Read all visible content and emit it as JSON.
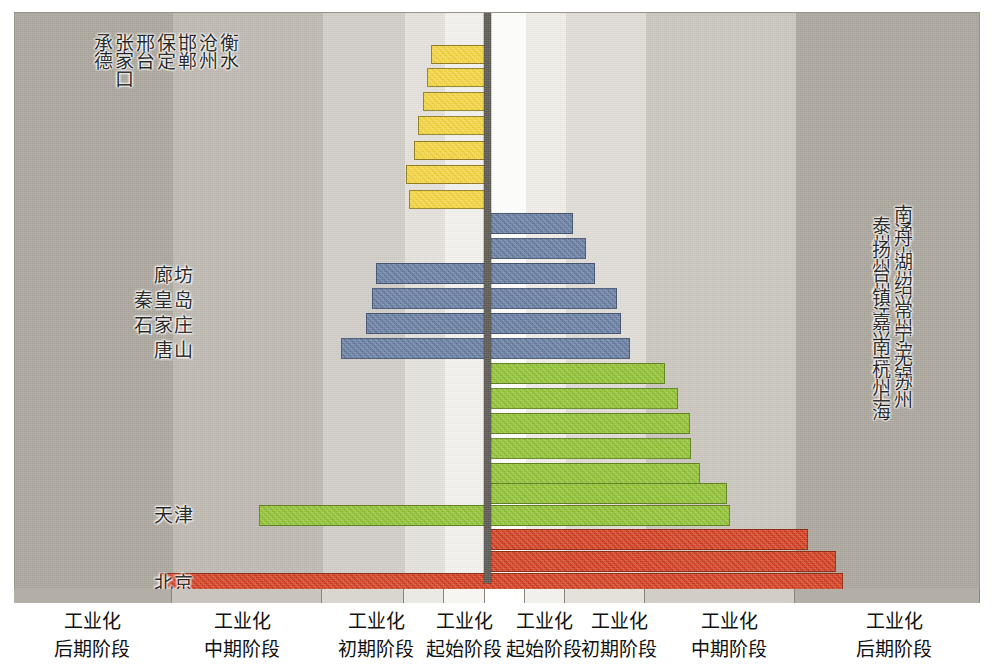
{
  "chart_data": {
    "type": "bar",
    "orientation": "horizontal-diverging",
    "title": "",
    "xlabel": "",
    "ylabel": "",
    "grid": false,
    "legend_position": "none",
    "center_axis_x": 487,
    "axis_band_labels": [
      {
        "line1": "工业化",
        "line2": "后期阶段",
        "side": "left"
      },
      {
        "line1": "工业化",
        "line2": "中期阶段",
        "side": "left"
      },
      {
        "line1": "工业化",
        "line2": "初期阶段",
        "side": "left"
      },
      {
        "line1": "工业化",
        "line2": "起始阶段",
        "side": "left"
      },
      {
        "line1": "工业化",
        "line2": "起始阶段",
        "side": "right"
      },
      {
        "line1": "工业化",
        "line2": "初期阶段",
        "side": "right"
      },
      {
        "line1": "工业化",
        "line2": "中期阶段",
        "side": "right"
      },
      {
        "line1": "工业化",
        "line2": "后期阶段",
        "side": "right"
      }
    ],
    "colors": {
      "yellow": "#f2d23c",
      "blue": "#64799e",
      "green": "#8dbf30",
      "red": "#cf3a1c",
      "axis": "#5b5852",
      "plot_background": "#b8b3ab"
    },
    "series": [
      {
        "name": "yellow",
        "color": "#f2d23c",
        "bars": [
          {
            "left": 431,
            "right": 487,
            "top": 45,
            "height": 19
          },
          {
            "left": 427,
            "right": 487,
            "top": 68,
            "height": 19
          },
          {
            "left": 423,
            "right": 487,
            "top": 92,
            "height": 19
          },
          {
            "left": 418,
            "right": 487,
            "top": 116,
            "height": 19
          },
          {
            "left": 414,
            "right": 487,
            "top": 141,
            "height": 19
          },
          {
            "left": 406,
            "right": 487,
            "top": 165,
            "height": 19
          },
          {
            "left": 409,
            "right": 487,
            "top": 190,
            "height": 19
          }
        ]
      },
      {
        "name": "blue",
        "color": "#64799e",
        "bars": [
          {
            "left": 487,
            "right": 573,
            "top": 213,
            "height": 21
          },
          {
            "left": 487,
            "right": 586,
            "top": 238,
            "height": 21
          },
          {
            "left": 376,
            "right": 595,
            "top": 263,
            "height": 21
          },
          {
            "left": 372,
            "right": 617,
            "top": 288,
            "height": 21
          },
          {
            "left": 366,
            "right": 621,
            "top": 313,
            "height": 21
          },
          {
            "left": 341,
            "right": 630,
            "top": 338,
            "height": 21
          }
        ]
      },
      {
        "name": "green",
        "color": "#8dbf30",
        "bars": [
          {
            "left": 487,
            "right": 665,
            "top": 363,
            "height": 21
          },
          {
            "left": 487,
            "right": 678,
            "top": 388,
            "height": 21
          },
          {
            "left": 487,
            "right": 690,
            "top": 413,
            "height": 21
          },
          {
            "left": 487,
            "right": 691,
            "top": 438,
            "height": 21
          },
          {
            "left": 487,
            "right": 700,
            "top": 463,
            "height": 21
          },
          {
            "left": 487,
            "right": 727,
            "top": 483,
            "height": 21
          },
          {
            "left": 259,
            "right": 730,
            "top": 505,
            "height": 21
          }
        ]
      },
      {
        "name": "red",
        "color": "#cf3a1c",
        "bars": [
          {
            "left": 487,
            "right": 808,
            "top": 529,
            "height": 21
          },
          {
            "left": 487,
            "right": 836,
            "top": 551,
            "height": 21
          },
          {
            "left": 160,
            "right": 843,
            "top": 573,
            "height": 21
          }
        ]
      }
    ],
    "left_vertical_labels": [
      "承德",
      "张家口",
      "邢台",
      "保定",
      "邯郸",
      "沧州",
      "衡水"
    ],
    "left_horizontal_labels": [
      {
        "text": "廊坊",
        "top": 260,
        "right": 196
      },
      {
        "text": "秦皇岛",
        "top": 285,
        "right": 196
      },
      {
        "text": "石家庄",
        "top": 310,
        "right": 196
      },
      {
        "text": "唐山",
        "top": 335,
        "right": 196
      },
      {
        "text": "天津",
        "top": 500,
        "right": 196
      },
      {
        "text": "北京",
        "top": 568,
        "right": 196
      }
    ],
    "right_vertical_labels": [
      "泰州",
      "南通",
      "扬州",
      "舟山",
      "台州",
      "湖州",
      "镇江",
      "绍兴",
      "嘉兴",
      "常州",
      "南京",
      "宁波",
      "杭州",
      "无锡",
      "上海",
      "苏州"
    ],
    "background_bands": [
      {
        "x": 0,
        "width": 158,
        "color": "#a9a49b"
      },
      {
        "x": 158,
        "width": 150,
        "color": "#bcb7af"
      },
      {
        "x": 308,
        "width": 82,
        "color": "#cfcbc5"
      },
      {
        "x": 390,
        "width": 40,
        "color": "#e3e0db"
      },
      {
        "x": 430,
        "width": 41,
        "color": "#f2f0ec"
      },
      {
        "x": 471,
        "width": 40,
        "color": "#fdfdfb"
      },
      {
        "x": 511,
        "width": 40,
        "color": "#efece7"
      },
      {
        "x": 551,
        "width": 80,
        "color": "#dedad4"
      },
      {
        "x": 631,
        "width": 150,
        "color": "#c8c4bc"
      },
      {
        "x": 781,
        "width": 185,
        "color": "#a9a49b"
      }
    ],
    "tick_cells": [
      {
        "x": 0,
        "width": 158,
        "color": "#b4afa6"
      },
      {
        "x": 158,
        "width": 150,
        "color": "#c9c5be"
      },
      {
        "x": 308,
        "width": 82,
        "color": "#d9d6d0"
      },
      {
        "x": 390,
        "width": 40,
        "color": "#ebe9e4"
      },
      {
        "x": 430,
        "width": 41,
        "color": "#f7f5f2"
      },
      {
        "x": 471,
        "width": 40,
        "color": "#ffffff"
      },
      {
        "x": 511,
        "width": 40,
        "color": "#f2f0ec"
      },
      {
        "x": 551,
        "width": 80,
        "color": "#e4e1db"
      },
      {
        "x": 631,
        "width": 150,
        "color": "#d2cec7"
      },
      {
        "x": 781,
        "width": 185,
        "color": "#b4afa6"
      }
    ]
  }
}
